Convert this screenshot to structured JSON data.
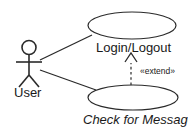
{
  "diagram": {
    "kind": "uml-use-case-diagram",
    "background_color": "#ffffff",
    "line_color": "#2a2a2a",
    "text_color": "#1a1a1a",
    "width": 188,
    "height": 133
  },
  "actor": {
    "label": "User",
    "name": "user-actor"
  },
  "use_cases": [
    {
      "id": "login-logout",
      "label": "Login/Logout",
      "italic": false
    },
    {
      "id": "check-for-messages",
      "label": "Check for Messages",
      "italic": true
    }
  ],
  "relationships": [
    {
      "id": "assoc-user-login",
      "type": "association",
      "from": "User",
      "to": "Login/Logout",
      "label": ""
    },
    {
      "id": "assoc-user-check",
      "type": "association",
      "from": "User",
      "to": "Check for Messages",
      "label": ""
    },
    {
      "id": "extend-check-login",
      "type": "extend",
      "from": "Check for Messages",
      "to": "Login/Logout",
      "label": "«extend»"
    }
  ]
}
